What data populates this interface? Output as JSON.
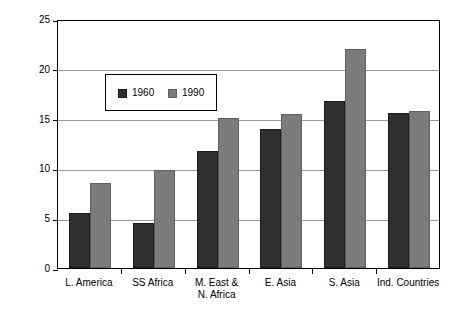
{
  "chart_data": {
    "type": "bar",
    "title": "",
    "subtitle": "",
    "xlabel": "",
    "ylabel": "",
    "ylim": [
      0,
      25
    ],
    "yticks": [
      0,
      5,
      10,
      15,
      20,
      25
    ],
    "grid": true,
    "legend_position": "inside-upper-left",
    "categories": [
      "L. America",
      "SS Africa",
      "M. East &\nN. Africa",
      "E. Asia",
      "S. Asia",
      "Ind. Countries"
    ],
    "series": [
      {
        "name": "1960",
        "color": "#2f2f2f",
        "values": [
          5.5,
          4.5,
          11.7,
          14.0,
          16.8,
          15.6
        ]
      },
      {
        "name": "1990",
        "color": "#7b7b7b",
        "values": [
          8.5,
          9.8,
          15.1,
          15.5,
          22.0,
          15.8
        ]
      }
    ]
  },
  "legend": {
    "entries": [
      {
        "label": "1960",
        "swatch": "dark-swatch"
      },
      {
        "label": "1990",
        "swatch": "gray-swatch"
      }
    ]
  },
  "axes": {
    "y_tick_labels": [
      "0",
      "5",
      "10",
      "15",
      "20",
      "25"
    ],
    "x_tick_labels": [
      "L. America",
      "SS Africa",
      "M. East &\nN. Africa",
      "E. Asia",
      "S. Asia",
      "Ind. Countries"
    ]
  },
  "colors": {
    "series_1960": "#2f2f2f",
    "series_1990": "#7b7b7b",
    "gridline": "#9a9a9a",
    "frame": "#000000",
    "background": "#ffffff"
  }
}
